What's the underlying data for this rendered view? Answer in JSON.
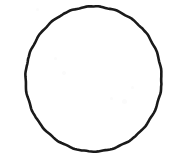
{
  "figure": {
    "kind": "line-drawing",
    "subject_name": "circle-outline",
    "caption": "",
    "background_color": "#ffffff",
    "stroke_color": "#1a1a1a",
    "stroke_width_px": 2.6,
    "fill": "none",
    "canvas": {
      "width_px": 183,
      "height_px": 162
    },
    "geometry": {
      "shape": "ellipse",
      "center_x_px": 93.5,
      "center_y_px": 79,
      "radius_x_px": 68,
      "radius_y_px": 72.5,
      "left_edge_px": 25,
      "right_edge_px": 162,
      "top_edge_px": 6,
      "bottom_edge_px": 152,
      "hand_drawn": true
    },
    "specks": [
      {
        "left_px": 54,
        "top_px": 57,
        "size_px": 3
      },
      {
        "left_px": 62,
        "top_px": 71,
        "size_px": 4
      },
      {
        "left_px": 110,
        "top_px": 97,
        "size_px": 3
      },
      {
        "left_px": 122,
        "top_px": 99,
        "size_px": 5
      },
      {
        "left_px": 131,
        "top_px": 86,
        "size_px": 3
      },
      {
        "left_px": 36,
        "top_px": 8,
        "size_px": 3
      }
    ]
  }
}
